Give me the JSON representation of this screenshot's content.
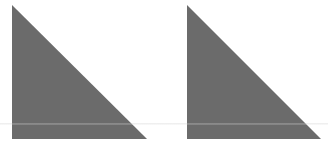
{
  "canvas": {
    "width": 328,
    "height": 153,
    "background": "#ffffff"
  },
  "shapes": [
    {
      "type": "right-triangle",
      "label": "left-triangle",
      "points": [
        [
          12,
          5
        ],
        [
          12,
          139
        ],
        [
          147,
          139
        ]
      ],
      "fill": "#6b6b6b"
    },
    {
      "type": "right-triangle",
      "label": "right-triangle",
      "points": [
        [
          187,
          5
        ],
        [
          187,
          139
        ],
        [
          321,
          139
        ]
      ],
      "fill": "#6b6b6b"
    }
  ],
  "artifacts": {
    "scanline_y": 123,
    "scanline_color": "#d8d8d8"
  }
}
